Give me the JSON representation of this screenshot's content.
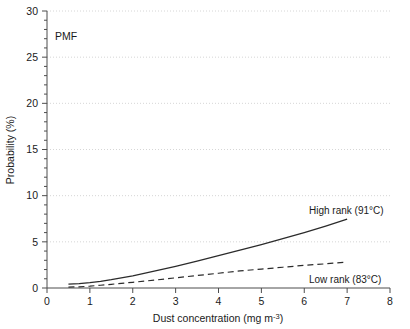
{
  "chart_data": {
    "type": "line",
    "title": "",
    "annotation": "PMF",
    "xlabel_main": "Dust concentration (mg m",
    "xlabel_sup": "-3",
    "xlabel_tail": ")",
    "ylabel": "Probability (%)",
    "xlim": [
      0,
      8
    ],
    "ylim": [
      0,
      30
    ],
    "xticks": [
      "0",
      "1",
      "2",
      "3",
      "4",
      "5",
      "6",
      "7",
      "8"
    ],
    "yticks": [
      "0",
      "5",
      "10",
      "15",
      "20",
      "25",
      "30"
    ],
    "xtick_values": [
      0,
      1,
      2,
      3,
      4,
      5,
      6,
      7,
      8
    ],
    "ytick_values": [
      0,
      5,
      10,
      15,
      20,
      25,
      30
    ],
    "minor_tick_step_y": 1,
    "grid": "horizontal-dotted",
    "grid_color": "#cccccc",
    "legend_position": "inline-right",
    "series": [
      {
        "name": "High rank (91°C)",
        "style": "solid",
        "color": "#2b2b2b",
        "label_x": 6.35,
        "label_y": 9.3,
        "x": [
          0.5,
          0.75,
          1.0,
          1.25,
          1.5,
          2.0,
          2.5,
          3.0,
          3.5,
          4.0,
          4.5,
          5.0,
          5.5,
          6.0,
          6.5,
          7.0
        ],
        "y": [
          0.42,
          0.48,
          0.58,
          0.72,
          0.9,
          1.32,
          1.82,
          2.35,
          2.9,
          3.5,
          4.1,
          4.7,
          5.35,
          6.0,
          6.7,
          7.45
        ]
      },
      {
        "name": "Low rank (83°C)",
        "style": "dashed",
        "color": "#2b2b2b",
        "label_x": 6.35,
        "label_y": 2.0,
        "x": [
          0.5,
          0.75,
          1.0,
          1.25,
          1.5,
          2.0,
          2.5,
          3.0,
          3.5,
          4.0,
          4.5,
          5.0,
          5.5,
          6.0,
          6.5,
          7.0
        ],
        "y": [
          0.1,
          0.13,
          0.2,
          0.3,
          0.4,
          0.62,
          0.85,
          1.1,
          1.35,
          1.6,
          1.85,
          2.05,
          2.25,
          2.45,
          2.62,
          2.8
        ]
      }
    ]
  },
  "axis": {
    "x_label_full": "Dust concentration (mg m-3)",
    "y_label_full": "Probability (%)"
  }
}
